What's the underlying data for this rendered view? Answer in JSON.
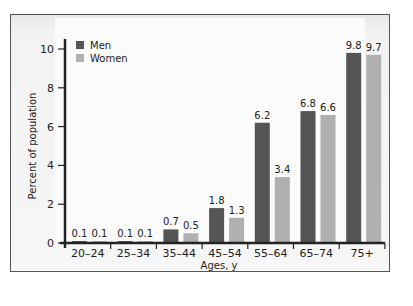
{
  "chart_data": {
    "type": "bar",
    "title": "",
    "xlabel": "Ages, y",
    "ylabel": "Percent of population",
    "ylim": [
      0,
      10
    ],
    "yticks": [
      0,
      2,
      4,
      6,
      8,
      10
    ],
    "categories": [
      "20–24",
      "25–34",
      "35–44",
      "45–54",
      "55–64",
      "65–74",
      "75+"
    ],
    "series": [
      {
        "name": "Men",
        "color": "#555555",
        "values": [
          0.1,
          0.1,
          0.7,
          1.8,
          6.2,
          6.8,
          9.8
        ]
      },
      {
        "name": "Women",
        "color": "#b0b0b0",
        "values": [
          0.1,
          0.1,
          0.5,
          1.3,
          3.4,
          6.6,
          9.7
        ]
      }
    ],
    "legend_position": "top-left",
    "grid": false
  },
  "legend": {
    "men": "Men",
    "women": "Women"
  },
  "axes": {
    "xlabel": "Ages, y",
    "ylabel": "Percent of population"
  }
}
